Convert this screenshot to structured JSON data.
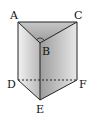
{
  "diagram": {
    "type": "triangular-prism",
    "labels": {
      "A": "A",
      "B": "B",
      "C": "C",
      "D": "D",
      "E": "E",
      "F": "F"
    },
    "colors": {
      "edge": "#222222",
      "face_light": "#e6e6e6",
      "face_dark": "#a8a8a8",
      "top": "#b0b0b0"
    }
  }
}
